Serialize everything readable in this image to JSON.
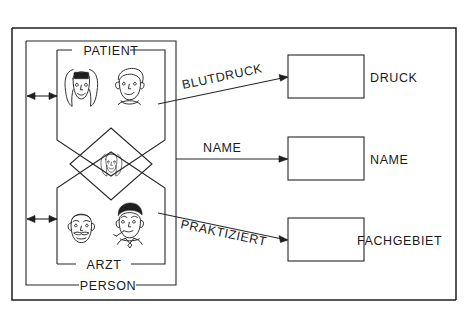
{
  "diagram": {
    "title_present": false,
    "language": "de",
    "outer_frame": {
      "name": "diagram-frame"
    },
    "entities": [
      {
        "id": "person",
        "label": "PERSON",
        "label_position": "bottom-center",
        "shape": "rectangle",
        "role": "supertype"
      },
      {
        "id": "patient",
        "label": "PATIENT",
        "label_position": "top-center",
        "shape": "pentagon-down",
        "role": "subtype",
        "icons": [
          "woman-face-icon",
          "boy-face-icon"
        ]
      },
      {
        "id": "arzt",
        "label": "ARZT",
        "label_position": "bottom-center",
        "shape": "pentagon-up",
        "role": "subtype",
        "icons": [
          "older-man-face-icon",
          "man-with-tie-face-icon"
        ]
      }
    ],
    "specialization": {
      "id": "specialization-diamond",
      "shape": "diamond",
      "label": "",
      "icon": "woman-face-icon"
    },
    "attributes": [
      {
        "id": "druck",
        "label": "DRUCK",
        "label_position": "right-of-box"
      },
      {
        "id": "name",
        "label": "NAME",
        "label_position": "right-of-box"
      },
      {
        "id": "fachgebiet",
        "label": "FACHGEBIET",
        "label_position": "right-of-box"
      }
    ],
    "relationships": [
      {
        "id": "blutdruck",
        "label": "BLUTDRUCK",
        "from": "patient",
        "to": "druck",
        "arrow": "single-right",
        "slope": "up"
      },
      {
        "id": "name-rel",
        "label": "NAME",
        "from": "person",
        "to": "name",
        "arrow": "single-right",
        "slope": "flat"
      },
      {
        "id": "praktiziert",
        "label": "PRAKTIZIERT",
        "from": "arzt",
        "to": "fachgebiet",
        "arrow": "single-right",
        "slope": "down"
      }
    ],
    "side_connectors": [
      {
        "id": "patient-left-connector",
        "arrow": "double-headed",
        "attached_to": "patient"
      },
      {
        "id": "arzt-left-connector",
        "arrow": "double-headed",
        "attached_to": "arzt"
      }
    ],
    "colors": {
      "background": "#ffffff",
      "ink": "#1f1f1f",
      "line": "#262626"
    }
  }
}
